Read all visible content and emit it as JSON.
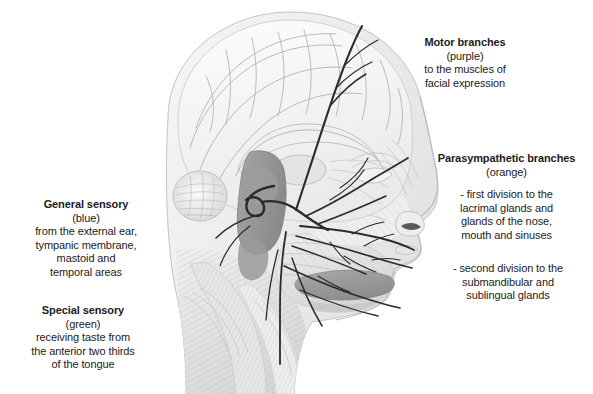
{
  "figure": {
    "background_color": "#ffffff",
    "ink_color": "#1b1b1b",
    "pencil_gray": "#8f8f8f"
  },
  "annotations": {
    "motor": {
      "heading": "Motor branches",
      "subheading": "(purple)",
      "lines": [
        "to the muscles of",
        "facial expression"
      ]
    },
    "parasympathetic": {
      "heading": "Parasympathetic branches",
      "subheading": "(orange)",
      "lines": [
        "- first division to the",
        "lacrimal glands and",
        "glands of the nose,",
        "mouth and sinuses"
      ]
    },
    "parasympathetic_second": {
      "lines": [
        "- second division to the",
        "submandibular and",
        "sublingual glands"
      ]
    },
    "general_sensory": {
      "heading": "General sensory",
      "subheading": "(blue)",
      "lines": [
        "from the external ear,",
        "tympanic membrane,",
        "mastoid and",
        "temporal areas"
      ]
    },
    "special_sensory": {
      "heading": "Special sensory",
      "subheading": "(green)",
      "lines": [
        "receiving taste from",
        "the anterior two thirds",
        "of the tongue"
      ]
    }
  },
  "illustration": {
    "label": "grayscale pencil drawing of midsagittal head showing cerebrum, cerebellum, brainstem, facial profile, neck muscles and facial nerve branches"
  }
}
